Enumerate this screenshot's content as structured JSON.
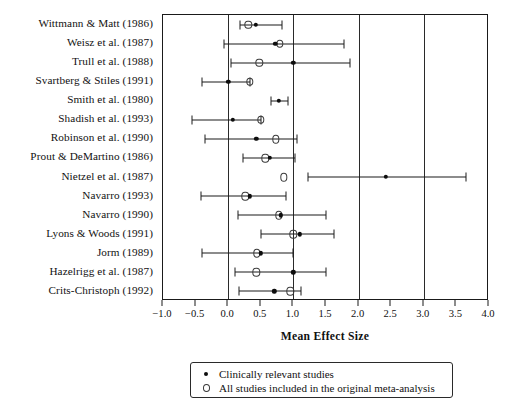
{
  "chart_data": {
    "type": "scatter",
    "title": "",
    "xlabel": "Mean Effect Size",
    "ylabel": "",
    "xlim": [
      -1.0,
      4.0
    ],
    "grid": true,
    "gridlines_x": [
      0.0,
      1.0,
      2.0,
      3.0
    ],
    "legend_position": "below-plot",
    "tick_labels": [
      "-1.0",
      "-0.5",
      "0.0",
      "0.5",
      "1.0",
      "1.5",
      "2.0",
      "2.5",
      "3.0",
      "3.5",
      "4.0"
    ],
    "tick_values": [
      -1.0,
      -0.5,
      0.0,
      0.5,
      1.0,
      1.5,
      2.0,
      2.5,
      3.0,
      3.5,
      4.0
    ],
    "series": [
      {
        "name": "Clinically relevant studies",
        "marker": "filled-circle"
      },
      {
        "name": "All studies included in the original meta-analysis",
        "marker": "open-circle"
      }
    ],
    "categories": [
      "Wittmann & Matt (1986)",
      "Weisz et al. (1987)",
      "Trull et al. (1988)",
      "Svartberg & Stiles (1991)",
      "Smith et al. (1980)",
      "Shadish et al. (1993)",
      "Robinson et al. (1990)",
      "Prout & DeMartino (1986)",
      "Nietzel et al. (1987)",
      "Navarro (1993)",
      "Navarro (1990)",
      "Lyons & Woods (1991)",
      "Jorm (1989)",
      "Hazelrigg et al. (1987)",
      "Crits-Christoph (1992)"
    ],
    "rows": [
      {
        "study": "Wittmann & Matt (1986)",
        "clinical": 0.42,
        "ci_low": 0.18,
        "ci_high": 0.82,
        "all_studies": 0.31
      },
      {
        "study": "Weisz et al. (1987)",
        "clinical": 0.72,
        "ci_low": -0.07,
        "ci_high": 1.78,
        "all_studies": 0.79
      },
      {
        "study": "Trull et al. (1988)",
        "clinical": 1.0,
        "ci_low": 0.05,
        "ci_high": 1.87,
        "all_studies": 0.48
      },
      {
        "study": "Svartberg & Stiles (1991)",
        "clinical": 0.0,
        "ci_low": -0.4,
        "ci_high": 0.33,
        "all_studies": 0.33
      },
      {
        "study": "Smith et al. (1980)",
        "clinical": 0.78,
        "ci_low": 0.66,
        "ci_high": 0.91,
        "all_studies": null
      },
      {
        "study": "Shadish et al. (1993)",
        "clinical": 0.07,
        "ci_low": -0.55,
        "ci_high": 0.5,
        "all_studies": 0.5
      },
      {
        "study": "Robinson et al. (1990)",
        "clinical": 0.43,
        "ci_low": -0.35,
        "ci_high": 1.05,
        "all_studies": 0.73
      },
      {
        "study": "Prout & DeMartino (1986)",
        "clinical": 0.64,
        "ci_low": 0.22,
        "ci_high": 1.02,
        "all_studies": 0.57
      },
      {
        "study": "Nietzel et al. (1987)",
        "clinical": 2.42,
        "ci_low": 1.22,
        "ci_high": 3.65,
        "all_studies": 0.85
      },
      {
        "study": "Navarro (1993)",
        "clinical": 0.33,
        "ci_low": -0.42,
        "ci_high": 0.88,
        "all_studies": 0.26
      },
      {
        "study": "Navarro (1990)",
        "clinical": 0.81,
        "ci_low": 0.15,
        "ci_high": 1.5,
        "all_studies": 0.78
      },
      {
        "study": "Lyons & Woods (1991)",
        "clinical": 1.1,
        "ci_low": 0.5,
        "ci_high": 1.62,
        "all_studies": 1.0
      },
      {
        "study": "Jorm (1989)",
        "clinical": 0.5,
        "ci_low": -0.4,
        "ci_high": 1.0,
        "all_studies": 0.44
      },
      {
        "study": "Hazelrigg et al. (1987)",
        "clinical": 1.0,
        "ci_low": 0.1,
        "ci_high": 1.5,
        "all_studies": 0.43
      },
      {
        "study": "Crits-Christoph (1992)",
        "clinical": 0.71,
        "ci_low": 0.16,
        "ci_high": 1.12,
        "all_studies": 0.95
      }
    ]
  },
  "legend": {
    "items": [
      {
        "label": "Clinically relevant studies",
        "marker": "filled-circle"
      },
      {
        "label": "All studies included in the original meta-analysis",
        "marker": "open-circle"
      }
    ]
  }
}
